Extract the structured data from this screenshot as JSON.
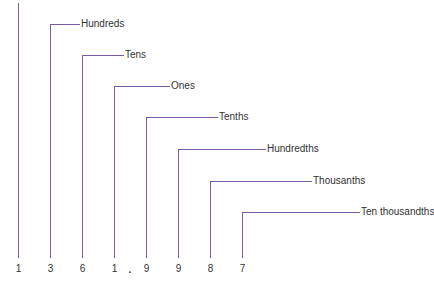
{
  "diagram": {
    "title": "",
    "digits": [
      "1",
      "3",
      "6",
      "1",
      ".",
      "9",
      "9",
      "8",
      "7"
    ],
    "places": [
      {
        "label": "",
        "digit": "1"
      },
      {
        "label": "Hundreds",
        "digit": "3"
      },
      {
        "label": "Tens",
        "digit": "6"
      },
      {
        "label": "Ones",
        "digit": "1"
      },
      {
        "label": "Tenths",
        "digit": "9"
      },
      {
        "label": "Hundredths",
        "digit": "9"
      },
      {
        "label": "Thousanths",
        "digit": "8"
      },
      {
        "label": "Ten thousandths",
        "digit": "7"
      }
    ],
    "decimal_point": ".",
    "line_color": "#7a5aa6"
  }
}
